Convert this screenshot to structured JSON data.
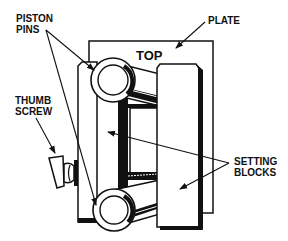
{
  "diagram": {
    "plate_marking": "TOP",
    "labels": {
      "piston_pins": [
        "PISTON",
        "PINS"
      ],
      "plate": [
        "PLATE"
      ],
      "thumb_screw": [
        "THUMB",
        "SCREW"
      ],
      "setting_blocks": [
        "SETTING",
        "BLOCKS"
      ]
    },
    "colors": {
      "line": "#111111",
      "background": "#ffffff"
    }
  }
}
